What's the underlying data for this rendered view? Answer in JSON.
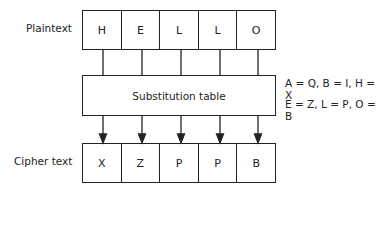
{
  "labels": {
    "plaintext": "Plaintext",
    "ciphertext": "Cipher text",
    "table": "Substitution table"
  },
  "plaintext": [
    "H",
    "E",
    "L",
    "L",
    "O"
  ],
  "ciphertext": [
    "X",
    "Z",
    "P",
    "P",
    "B"
  ],
  "mapping": {
    "line1": "A = Q, B = I, H = X",
    "line2": "E = Z, L = P, O = B"
  }
}
